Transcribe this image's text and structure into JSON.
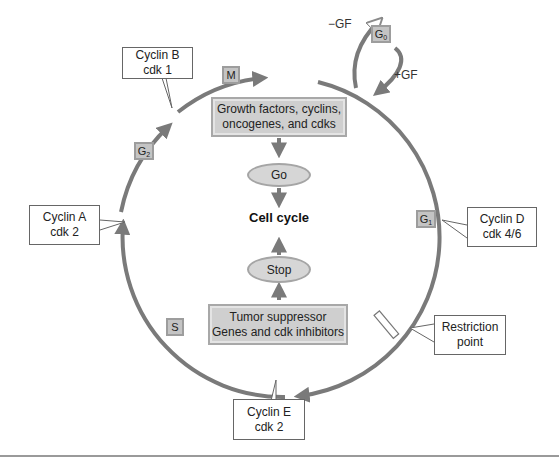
{
  "diagram": {
    "type": "cell-cycle",
    "center_label": "Cell cycle",
    "promoters_box": {
      "line1": "Growth factors, cyclins,",
      "line2": "oncogenes, and cdks"
    },
    "go_oval": "Go",
    "stop_oval": "Stop",
    "suppressors_box": {
      "line1": "Tumor suppressor",
      "line2": "Genes and cdk inhibitors"
    },
    "phases": {
      "M": {
        "main": "M",
        "sub": ""
      },
      "G0": {
        "main": "G",
        "sub": "0"
      },
      "G1": {
        "main": "G",
        "sub": "1"
      },
      "S": {
        "main": "S",
        "sub": ""
      },
      "G2": {
        "main": "G",
        "sub": "2"
      }
    },
    "gf_labels": {
      "minus": "−GF",
      "plus": "+GF"
    },
    "callouts": {
      "cyclin_b": {
        "line1": "Cyclin B",
        "line2": "cdk 1"
      },
      "cyclin_a": {
        "line1": "Cyclin A",
        "line2": "cdk 2"
      },
      "cyclin_d": {
        "line1": "Cyclin D",
        "line2": "cdk 4/6"
      },
      "restriction": {
        "line1": "Restriction",
        "line2": "point"
      },
      "cyclin_e": {
        "line1": "Cyclin E",
        "line2": "cdk 2"
      }
    },
    "colors": {
      "cycle_stroke": "#7a7a7a",
      "box_fill": "#cfcfcf",
      "box_border": "#a8a8a8",
      "callout_border": "#666666"
    }
  }
}
